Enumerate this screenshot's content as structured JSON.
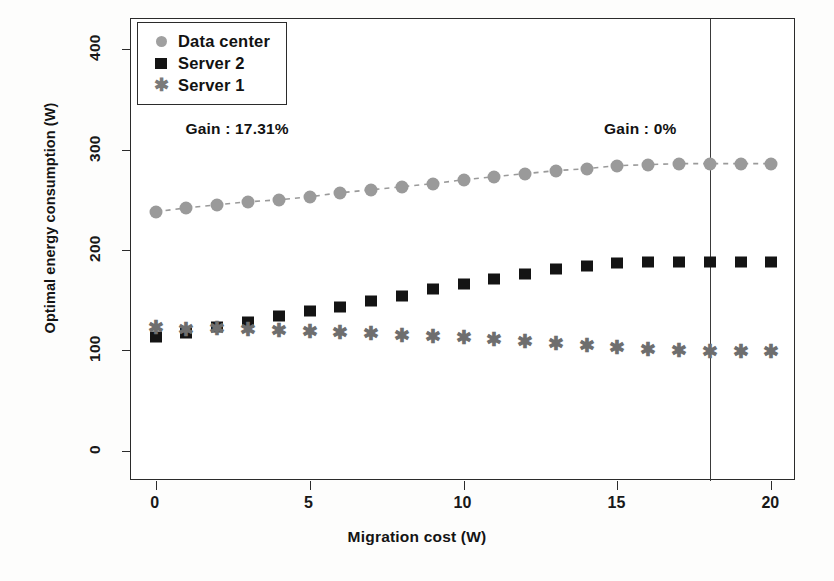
{
  "chart_data": {
    "type": "scatter",
    "title": "",
    "xlabel": "Migration cost (W)",
    "ylabel": "Optimal energy consumption (W)",
    "xlim": [
      -0.8,
      20.8
    ],
    "ylim": [
      -30,
      430
    ],
    "xticks": [
      0,
      5,
      10,
      15,
      20
    ],
    "xticklabels": [
      "0",
      "5",
      "10",
      "15",
      "20"
    ],
    "yticks": [
      0,
      100,
      200,
      300,
      400
    ],
    "yticklabels": [
      "0",
      "100",
      "200",
      "300",
      "400"
    ],
    "grid": false,
    "legend_position": "top-left",
    "x": [
      0,
      1,
      2,
      3,
      4,
      5,
      6,
      7,
      8,
      9,
      10,
      11,
      12,
      13,
      14,
      15,
      16,
      17,
      18,
      19,
      20
    ],
    "series": [
      {
        "name": "Data center",
        "marker": "circle",
        "color": "#9a9a9a",
        "linestyle": "dashed",
        "values": [
          238,
          242,
          245,
          248,
          250,
          253,
          257,
          260,
          263,
          266,
          270,
          273,
          276,
          279,
          281,
          284,
          285,
          286,
          286,
          286,
          286
        ]
      },
      {
        "name": "Server 2",
        "marker": "square",
        "color": "#141414",
        "linestyle": "none",
        "values": [
          113,
          117,
          123,
          128,
          134,
          139,
          143,
          149,
          154,
          161,
          166,
          171,
          176,
          181,
          184,
          187,
          188,
          188,
          188,
          188,
          188
        ]
      },
      {
        "name": "Server 1",
        "marker": "asterisk",
        "color": "#6e6e6e",
        "linestyle": "none",
        "values": [
          122,
          120,
          121,
          120,
          119,
          118,
          117,
          116,
          114,
          113,
          112,
          110,
          108,
          106,
          104,
          102,
          100,
          99,
          98,
          98,
          98
        ]
      }
    ],
    "annotations": [
      {
        "text": "Gain : 17.31%",
        "x": 1.0,
        "y": 318
      },
      {
        "text": "Gain : 0%",
        "x": 14.6,
        "y": 318
      }
    ],
    "reference_lines": [
      {
        "orientation": "vertical",
        "x": 18,
        "color": "#3a3a3a"
      }
    ]
  },
  "legend": {
    "items": [
      {
        "label": "Data center",
        "marker": "circle-icon"
      },
      {
        "label": "Server 2",
        "marker": "square-icon"
      },
      {
        "label": "Server 1",
        "marker": "asterisk-icon"
      }
    ]
  }
}
